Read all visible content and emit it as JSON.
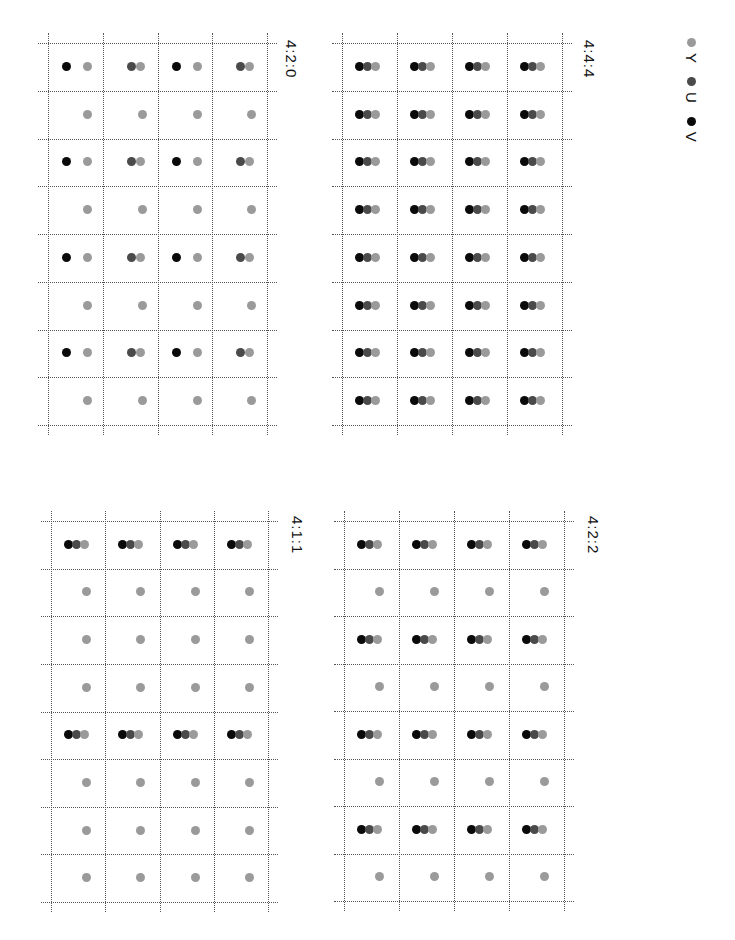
{
  "legend": {
    "items": [
      {
        "key": "y",
        "label": "Y",
        "color": "#9a9a9a"
      },
      {
        "key": "u",
        "label": "U",
        "color": "#4a4a4a"
      },
      {
        "key": "v",
        "label": "V",
        "color": "#0a0a0a"
      }
    ]
  },
  "panels": [
    {
      "id": "444",
      "label": "4:4:4",
      "box": {
        "left": 342,
        "top": 43,
        "width": 220,
        "height": 382
      },
      "label_pos": {
        "left": 598,
        "top": 40
      },
      "cols": 4,
      "rows": 8,
      "pattern": "full"
    },
    {
      "id": "420",
      "label": "4:2:0",
      "box": {
        "left": 48,
        "top": 43,
        "width": 219,
        "height": 382
      },
      "label_pos": {
        "left": 300,
        "top": 40
      },
      "cols": 4,
      "rows": 8,
      "pattern": "420"
    },
    {
      "id": "422",
      "label": "4:2:2",
      "box": {
        "left": 344,
        "top": 521,
        "width": 220,
        "height": 380
      },
      "label_pos": {
        "left": 602,
        "top": 516
      },
      "cols": 4,
      "rows": 8,
      "pattern": "422"
    },
    {
      "id": "411",
      "label": "4:1:1",
      "box": {
        "left": 51,
        "top": 521,
        "width": 217,
        "height": 381
      },
      "label_pos": {
        "left": 306,
        "top": 516
      },
      "cols": 4,
      "rows": 8,
      "pattern": "411"
    }
  ]
}
